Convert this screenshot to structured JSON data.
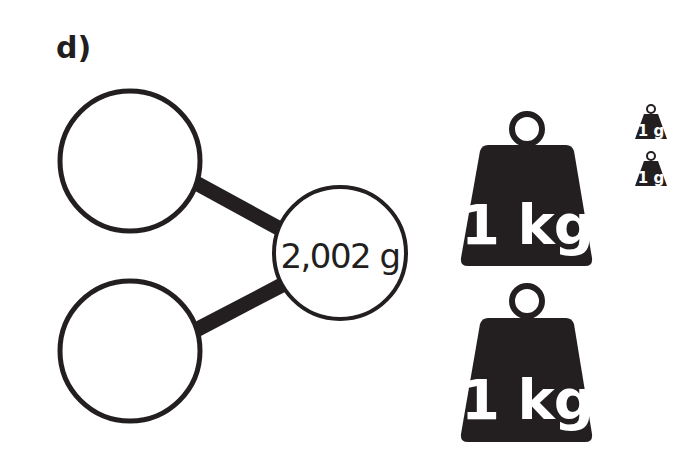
{
  "question": {
    "label": "d)"
  },
  "part_whole_model": {
    "whole": {
      "value": "2,002 g"
    },
    "parts": [
      {
        "value": ""
      },
      {
        "value": ""
      }
    ]
  },
  "weights": {
    "kilogram": [
      {
        "label": "1 kg"
      },
      {
        "label": "1 kg"
      }
    ],
    "gram": [
      {
        "label": "1 g"
      },
      {
        "label": "1 g"
      }
    ]
  },
  "colors": {
    "ink": "#231f20",
    "background": "#ffffff"
  }
}
